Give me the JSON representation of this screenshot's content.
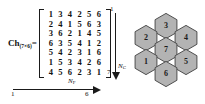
{
  "figure": {
    "matrix": {
      "label_base": "Ch",
      "label_sub": "(7×6)",
      "equals": "=",
      "rows": [
        [
          1,
          3,
          4,
          2,
          5,
          6
        ],
        [
          2,
          4,
          1,
          5,
          6,
          3
        ],
        [
          3,
          6,
          2,
          1,
          4,
          5
        ],
        [
          6,
          3,
          5,
          4,
          1,
          2
        ],
        [
          5,
          4,
          2,
          3,
          1,
          6
        ],
        [
          1,
          5,
          3,
          4,
          2,
          6
        ],
        [
          4,
          5,
          6,
          2,
          3,
          1
        ]
      ],
      "n_rows": 7,
      "n_cols": 6
    },
    "axis_horizontal": {
      "name_base": "N",
      "name_sub": "F",
      "tick_start": "1",
      "tick_end": "6"
    },
    "axis_vertical": {
      "name_base": "N",
      "name_sub": "C",
      "tick_start": "1",
      "tick_end": "7"
    },
    "cluster": {
      "cells": [
        {
          "id": "hex-3",
          "label": "3",
          "cx": 37,
          "cy": 17
        },
        {
          "id": "hex-2",
          "label": "2",
          "cx": 17,
          "cy": 29
        },
        {
          "id": "hex-4",
          "label": "4",
          "cx": 57,
          "cy": 29
        },
        {
          "id": "hex-7",
          "label": "7",
          "cx": 37,
          "cy": 41
        },
        {
          "id": "hex-1",
          "label": "1",
          "cx": 17,
          "cy": 53
        },
        {
          "id": "hex-5",
          "label": "5",
          "cx": 57,
          "cy": 53
        },
        {
          "id": "hex-6",
          "label": "6",
          "cx": 37,
          "cy": 65
        }
      ],
      "fill_color": "#b3b3b3",
      "stroke_color": "#4d4d4d"
    }
  }
}
